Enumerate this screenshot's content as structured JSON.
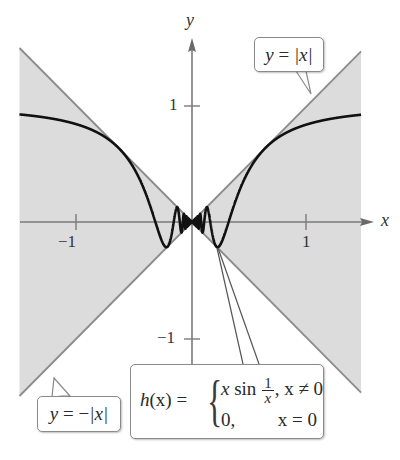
{
  "chart_data": {
    "type": "line",
    "title": "",
    "xlabel": "x",
    "ylabel": "y",
    "xlim": [
      -1.5,
      1.47
    ],
    "ylim": [
      -1.5,
      1.5
    ],
    "grid": false,
    "x_ticks": [
      -1,
      1
    ],
    "x_tick_labels": [
      "−1",
      "1"
    ],
    "y_ticks": [
      1,
      -1
    ],
    "y_tick_labels": [
      "1",
      "−1"
    ],
    "shaded_region": "between y = |x| and y = −|x|",
    "series": [
      {
        "name": "y = |x|",
        "expression": "abs(x)",
        "color": "#8c8c8c"
      },
      {
        "name": "y = −|x|",
        "expression": "-abs(x)",
        "color": "#8c8c8c"
      },
      {
        "name": "h(x)",
        "expression": "x*sin(1/x), h(0)=0",
        "color": "#111111",
        "sample_points": [
          [
            -1.5,
            0.9432
          ],
          [
            -1.0,
            0.8415
          ],
          [
            -0.5,
            0.4546
          ],
          [
            -0.3,
            -0.057
          ],
          [
            -0.2172,
            -0.2172
          ],
          [
            -0.15,
            0.0561
          ],
          [
            -0.1061,
            0.1061
          ],
          [
            0,
            0
          ],
          [
            0.1061,
            0.1061
          ],
          [
            0.15,
            0.0561
          ],
          [
            0.2172,
            -0.2172
          ],
          [
            0.3,
            -0.057
          ],
          [
            0.5,
            0.4546
          ],
          [
            1.0,
            0.8415
          ],
          [
            1.47,
            0.9158
          ]
        ]
      }
    ],
    "annotations": [
      {
        "text": "y = |x|",
        "points_to": [
          1.04,
          1.0
        ]
      },
      {
        "text": "y = −|x|",
        "points_to": [
          -1.46,
          -1.46
        ]
      },
      {
        "text": "h(x) = { x sin(1/x), x ≠ 0 ; 0, x = 0 }",
        "points_to": [
          0.2172,
          -0.2172
        ]
      }
    ]
  },
  "labels": {
    "x_axis": "x",
    "y_axis": "y",
    "tick_x_neg1": "−1",
    "tick_x_pos1": "1",
    "tick_y_pos1": "1",
    "tick_y_neg1": "−1"
  },
  "callouts": {
    "abs": {
      "lhs": "y",
      "eq": " = ",
      "rhs": "|x|"
    },
    "negabs": {
      "lhs": "y",
      "eq": " = −",
      "rhs": "|x|"
    },
    "h": {
      "lhs_fn": "h",
      "lhs_arg": "(x)",
      "eq": " = ",
      "brace": "{",
      "row1_x": "x",
      "row1_sin": " sin ",
      "row1_num": "1",
      "row1_den": "x",
      "row1_cond": ", x ≠ 0",
      "row2_val": "0,",
      "row2_cond": "x = 0"
    }
  },
  "colors": {
    "shade": "#dcdcdc",
    "boundary": "#8c8c8c",
    "curve": "#111111",
    "axis": "#7a7a7a"
  }
}
